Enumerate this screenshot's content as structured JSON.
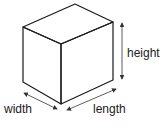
{
  "diagram": {
    "type": "rectangular-prism-dimensions",
    "labels": {
      "height": "height",
      "width": "width",
      "length": "length"
    },
    "colors": {
      "stroke": "#1a1a1a",
      "arrow": "#333333",
      "background": "#ffffff"
    }
  }
}
